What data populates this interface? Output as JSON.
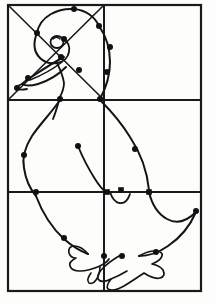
{
  "document": {
    "title": "Grid drawing exercise — duck outline",
    "subject": "duck",
    "technique": "grid-transfer line drawing",
    "background_color": "#fdfdfb",
    "ink_color": "#141414"
  },
  "grid": {
    "columns": 2,
    "rows": 3,
    "cells_total": 6,
    "frame": {
      "x": 8,
      "y": 5,
      "width": 193,
      "height": 286
    },
    "border_stroke_width": 2.2,
    "inner_stroke_width": 2.0,
    "color": "#1a1a1a",
    "vertical_dividers_x": [
      104
    ],
    "horizontal_dividers_y": [
      100,
      192
    ],
    "outer_box": {
      "left": 8,
      "top": 5,
      "right": 201,
      "bottom": 291
    }
  },
  "diagonals": {
    "cell": "top-left",
    "stroke_width": 1.6,
    "lines": [
      {
        "name": "diagonal-down-right",
        "x1": 9,
        "y1": 6,
        "x2": 103,
        "y2": 99
      },
      {
        "name": "diagonal-up-right",
        "x1": 9,
        "y1": 99,
        "x2": 103,
        "y2": 6
      }
    ]
  },
  "paths": {
    "head_crown": "M 37 33 C 40 16 58 8 74 9 C 86 10 95 17 99 26",
    "head_lower_left": "M 37 33 C 33 43 34 52 40 58 C 44 62 50 64 57 63",
    "head_cheek": "M 57 63 C 64 62 68 57 69 52 C 70 47 68 42 64 39",
    "beak_upper": "M 64 57 C 54 62 42 70 33 76 C 28 79 24 82 22 84",
    "beak_lower": "M 22 84 C 25 86 31 86 38 84 C 48 81 59 74 66 67",
    "beak_tip": "M 22 84 C 19 85 17 86 16 88 C 18 90 22 90 27 89",
    "beak_line_inner": "M 30 80 C 40 76 52 70 62 62",
    "eye": {
      "cx": 57,
      "cy": 42,
      "rx": 6.5,
      "ry": 6.0
    },
    "eye_inner": "M 53 39 C 55 37 58 37 60 39",
    "head_chin": "M 57 63 C 60 69 63 76 64 83 C 64 88 62 93 60 97",
    "neck_back": "M 99 26 C 106 36 110 50 110 62 C 110 76 106 88 100 99",
    "neck_front": "M 60 97 C 58 104 56 112 53 119",
    "body_left": "M 60 100 C 52 112 40 124 32 136 C 25 147 22 158 24 168 C 26 182 31 190 36 196",
    "body_left_lower": "M 36 196 C 42 212 52 228 64 239 C 72 246 80 251 88 254",
    "body_back": "M 101 101 C 112 112 122 124 130 137 C 140 152 147 170 149 190",
    "body_bottom": "M 149 192 C 152 205 158 214 167 219 C 176 224 186 222 196 212",
    "tail_curve": "M 196 212 C 190 226 180 238 168 246 C 158 253 148 256 139 256",
    "breast_notch": "M 110 192 C 112 198 115 202 119 203 C 124 204 128 200 130 194",
    "wing_line": "M 78 146 C 82 156 88 168 95 179 C 100 187 104 191 107 193",
    "foot_left": "M 88 254 C 84 249 79 246 74 246 C 70 246 68 249 69 253 C 70 256 73 258 76 258 C 72 260 69 263 70 266 C 71 269 75 271 80 271 C 86 271 93 269 100 266 C 104 264 107 262 109 259",
    "foot_left_toe": "M 100 266 C 100 271 99 276 96 280 C 94 283 91 284 89 283 C 87 281 88 277 91 273",
    "foot_right": "M 119 256 C 114 259 108 263 103 268 C 99 272 97 276 98 279 C 100 282 105 282 111 279 C 108 283 106 287 108 289 C 111 291 117 290 124 286 C 131 282 138 277 144 273 C 150 277 156 279 160 278 C 164 277 165 274 163 270 C 161 267 157 265 152 264 C 157 262 161 259 162 256 C 163 253 160 251 155 251 C 150 251 144 253 139 256",
    "foot_right_inner": "M 111 279 C 116 277 122 274 127 271"
  },
  "markers": {
    "dot_radius": 3.0,
    "square_size": 5.6,
    "dots": [
      {
        "name": "marker-head-crown-left",
        "x": 37,
        "y": 33
      },
      {
        "name": "marker-head-top",
        "x": 74,
        "y": 9
      },
      {
        "name": "marker-head-neck-top",
        "x": 99,
        "y": 26
      },
      {
        "name": "marker-head-cheek",
        "x": 64,
        "y": 39
      },
      {
        "name": "marker-head-jaw",
        "x": 61,
        "y": 57
      },
      {
        "name": "marker-beak-mid",
        "x": 28,
        "y": 78
      },
      {
        "name": "marker-beak-tip",
        "x": 17,
        "y": 88
      },
      {
        "name": "marker-chin",
        "x": 79,
        "y": 70
      },
      {
        "name": "marker-neck-upper",
        "x": 110,
        "y": 47
      },
      {
        "name": "marker-neck-lower",
        "x": 107,
        "y": 72
      },
      {
        "name": "marker-neck-front-cross",
        "x": 60,
        "y": 99
      },
      {
        "name": "marker-neck-back-cross",
        "x": 100,
        "y": 99
      },
      {
        "name": "marker-body-left-mid",
        "x": 24,
        "y": 155
      },
      {
        "name": "marker-body-left-cross",
        "x": 36,
        "y": 192
      },
      {
        "name": "marker-body-back-mid",
        "x": 135,
        "y": 149
      },
      {
        "name": "marker-wing-start",
        "x": 78,
        "y": 146
      },
      {
        "name": "marker-tail-right",
        "x": 196,
        "y": 211
      },
      {
        "name": "marker-leg-left-top",
        "x": 64,
        "y": 238
      },
      {
        "name": "marker-foot-left-join",
        "x": 104,
        "y": 256
      },
      {
        "name": "marker-foot-right-join",
        "x": 122,
        "y": 256
      },
      {
        "name": "marker-tail-tip",
        "x": 156,
        "y": 252
      }
    ],
    "squares": [
      {
        "name": "marker-wing-cross",
        "x": 107,
        "y": 192
      },
      {
        "name": "marker-breast-notch",
        "x": 121,
        "y": 190
      },
      {
        "name": "marker-body-back-cross",
        "x": 149,
        "y": 192
      }
    ]
  },
  "legend": {
    "dot_meaning": "curve control / grid intersection point",
    "square_meaning": "grid-line crossing point"
  }
}
